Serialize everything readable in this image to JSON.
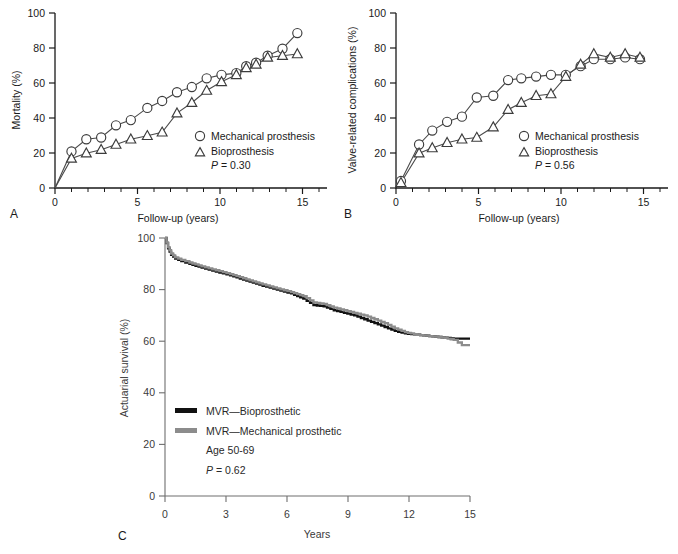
{
  "figure": {
    "panels": [
      {
        "letter": "A",
        "ylabel": "Mortality (%)",
        "xlabel": "Follow-up (years)",
        "pvalue": "= 0.30",
        "pprefix": "P",
        "legend": [
          {
            "marker": "circle",
            "label": "Mechanical prosthesis"
          },
          {
            "marker": "triangle",
            "label": "Bioprosthesis"
          }
        ]
      },
      {
        "letter": "B",
        "ylabel": "Valve-related complications (%)",
        "xlabel": "Follow-up (years)",
        "pvalue": "= 0.56",
        "pprefix": "P",
        "legend": [
          {
            "marker": "circle",
            "label": "Mechanical prosthesis"
          },
          {
            "marker": "triangle",
            "label": "Bioprosthesis"
          }
        ]
      },
      {
        "letter": "C",
        "ylabel": "Actuarial survival (%)",
        "xlabel": "Years",
        "pvalue": "= 0.62",
        "pprefix": "P",
        "agenote": "Age 50-69",
        "legend": [
          {
            "marker": "line-black",
            "label": "MVR—Bioprosthetic"
          },
          {
            "marker": "line-gray",
            "label": "MVR—Mechanical prosthetic"
          }
        ]
      }
    ],
    "colors": {
      "black_curve": "#111111",
      "gray_curve": "#8c8c8c",
      "axis": "#1a1a1a",
      "axis_c": "#6e6e6e",
      "marker_stroke": "#3c3c3c"
    }
  },
  "chart_data": [
    {
      "type": "line",
      "panel": "A",
      "title": "",
      "xlabel": "Follow-up (years)",
      "ylabel": "Mortality (%)",
      "xlim": [
        0,
        16.5
      ],
      "ylim": [
        0,
        108
      ],
      "xticks": [
        0,
        5,
        10,
        15
      ],
      "xticks_minor": [
        1,
        2,
        3,
        4,
        6,
        7,
        8,
        9,
        11,
        12,
        13,
        14,
        16
      ],
      "yticks": [
        0,
        20,
        40,
        60,
        80,
        100
      ],
      "grid": false,
      "legend_position": "inside-right",
      "annotation": "P = 0.30",
      "series": [
        {
          "name": "Mechanical prosthesis",
          "marker": "circle",
          "x": [
            0,
            1.0,
            1.9,
            2.8,
            3.7,
            4.6,
            5.6,
            6.5,
            7.4,
            8.3,
            9.2,
            10.1,
            11.0,
            11.6,
            12.2,
            12.9,
            13.8,
            14.7
          ],
          "y": [
            0,
            21,
            28,
            29,
            36,
            39,
            46,
            50,
            55,
            58,
            63,
            65,
            66,
            70,
            72,
            76,
            80,
            89
          ]
        },
        {
          "name": "Bioprosthesis",
          "marker": "triangle",
          "x": [
            0,
            1.0,
            1.9,
            2.8,
            3.7,
            4.6,
            5.6,
            6.5,
            7.4,
            8.3,
            9.2,
            10.1,
            11.0,
            11.6,
            12.2,
            12.9,
            13.8,
            14.7
          ],
          "y": [
            0,
            17,
            20,
            22,
            25,
            28,
            30,
            32,
            43,
            49,
            56,
            61,
            65,
            69,
            71,
            75,
            76,
            77
          ]
        }
      ]
    },
    {
      "type": "line",
      "panel": "B",
      "title": "",
      "xlabel": "Follow-up (years)",
      "ylabel": "Valve-related complications (%)",
      "xlim": [
        0,
        16.5
      ],
      "ylim": [
        0,
        108
      ],
      "xticks": [
        0,
        5,
        10,
        15
      ],
      "xticks_minor": [
        1,
        2,
        3,
        4,
        6,
        7,
        8,
        9,
        11,
        12,
        13,
        14,
        16
      ],
      "yticks": [
        0,
        20,
        40,
        60,
        80,
        100
      ],
      "grid": false,
      "legend_position": "inside-right",
      "annotation": "P = 0.56",
      "series": [
        {
          "name": "Mechanical prosthesis",
          "marker": "circle",
          "x": [
            0.3,
            1.4,
            2.2,
            3.1,
            4.0,
            4.9,
            5.9,
            6.8,
            7.6,
            8.5,
            9.4,
            10.3,
            11.2,
            12.0,
            13.0,
            13.9,
            14.8
          ],
          "y": [
            4,
            25,
            33,
            38,
            41,
            52,
            53,
            62,
            63,
            64,
            65,
            65,
            70,
            74,
            74,
            75,
            74
          ]
        },
        {
          "name": "Bioprosthesis",
          "marker": "triangle",
          "x": [
            0.3,
            1.4,
            2.2,
            3.1,
            4.0,
            4.9,
            5.9,
            6.8,
            7.6,
            8.5,
            9.4,
            10.3,
            11.2,
            12.0,
            13.0,
            13.9,
            14.8
          ],
          "y": [
            3,
            20,
            23,
            26,
            28,
            29,
            35,
            45,
            49,
            53,
            54,
            64,
            71,
            77,
            75,
            77,
            75
          ]
        }
      ]
    },
    {
      "type": "line",
      "panel": "C",
      "title": "",
      "xlabel": "Years",
      "ylabel": "Actuarial survival (%)",
      "xlim": [
        0,
        15
      ],
      "ylim": [
        0,
        100
      ],
      "xticks": [
        0,
        3,
        6,
        9,
        12,
        15
      ],
      "yticks": [
        0,
        20,
        40,
        60,
        80,
        100
      ],
      "grid": false,
      "legend_position": "inside-lower-left",
      "annotations": [
        "Age 50-69",
        "P = 0.62"
      ],
      "series": [
        {
          "name": "MVR—Bioprosthetic",
          "color": "#111111",
          "step": true,
          "x": [
            0,
            0.15,
            0.3,
            0.5,
            0.8,
            1.2,
            1.8,
            2.5,
            3.2,
            4.0,
            4.8,
            5.5,
            6.2,
            6.8,
            7.3,
            7.8,
            8.3,
            8.8,
            9.3,
            9.8,
            10.3,
            10.8,
            11.3,
            11.8,
            12.4,
            13.0,
            13.6,
            14.2,
            14.6,
            15.0
          ],
          "y": [
            100,
            96,
            93.5,
            92,
            91,
            90,
            88.5,
            87,
            85.5,
            83.5,
            81.5,
            80,
            78.5,
            76.5,
            74,
            73.5,
            72,
            71,
            70,
            68.5,
            67,
            65.5,
            64,
            63,
            62.5,
            62,
            61.5,
            61,
            61,
            61
          ]
        },
        {
          "name": "MVR—Mechanical prosthetic",
          "color": "#8c8c8c",
          "step": true,
          "x": [
            0,
            0.15,
            0.3,
            0.5,
            0.8,
            1.2,
            1.8,
            2.5,
            3.2,
            4.0,
            4.8,
            5.5,
            6.2,
            6.8,
            7.3,
            7.8,
            8.3,
            8.8,
            9.3,
            9.8,
            10.3,
            10.8,
            11.3,
            11.8,
            12.4,
            13.0,
            13.6,
            14.2,
            14.6,
            15.0
          ],
          "y": [
            100,
            96.5,
            94,
            92.5,
            91.5,
            90.5,
            89,
            87.5,
            86,
            84,
            82,
            80.5,
            79,
            77.5,
            75,
            74.5,
            73,
            72,
            71,
            70,
            68.5,
            67,
            65,
            63.5,
            62.5,
            62,
            61.5,
            60.5,
            58.5,
            58.5
          ]
        }
      ]
    }
  ]
}
